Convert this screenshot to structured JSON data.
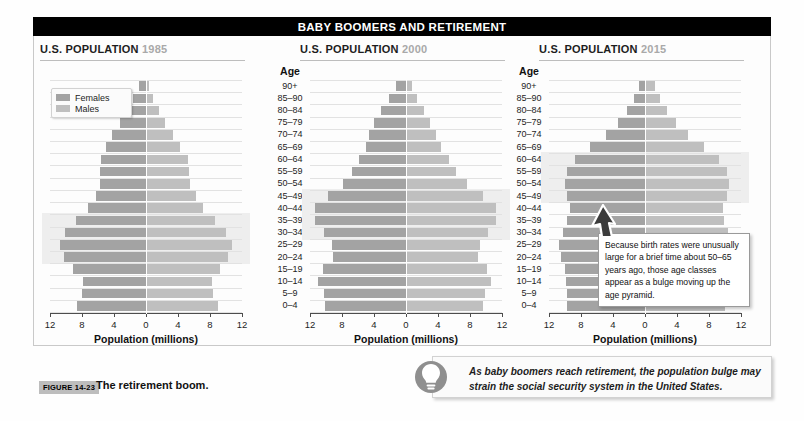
{
  "banner": {
    "title": "BABY BOOMERS AND RETIREMENT"
  },
  "figure": {
    "tag": "FIGURE 14-23",
    "caption": "The retirement boom."
  },
  "legend": {
    "females_label": "Females",
    "males_label": "Males",
    "females_color": "#a3a3a3",
    "males_color": "#bfbfbf"
  },
  "age_axis": {
    "header": "Age",
    "labels": [
      "90+",
      "85–90",
      "80–84",
      "75–79",
      "70–74",
      "65–69",
      "60–64",
      "55–59",
      "50–54",
      "45–49",
      "40–44",
      "35–39",
      "30–34",
      "25–29",
      "20–24",
      "15–19",
      "10–14",
      "5–9",
      "0–4"
    ]
  },
  "x_axis": {
    "label": "Population (millions)",
    "ticks": [
      "12",
      "8",
      "4",
      "0",
      "4",
      "8",
      "12"
    ]
  },
  "callout": {
    "text": "Because birth rates were unusually large for a brief time about 50–65 years ago, those age classes appear as a bulge moving up the age pyramid."
  },
  "tip": {
    "icon": "lightbulb-icon",
    "text": "As baby boomers reach retirement, the population bulge may strain the social security system in the United States."
  },
  "chart_data": [
    {
      "type": "bar",
      "title": "U.S. POPULATION 1985",
      "title_main": "U.S. POPULATION",
      "year": "1985",
      "xlabel": "Population (millions)",
      "ylabel": "Age",
      "xlim": [
        -12,
        12
      ],
      "grid": true,
      "legend_position": "top-left",
      "categories": [
        "90+",
        "85–90",
        "80–84",
        "75–79",
        "70–74",
        "65–69",
        "60–64",
        "55–59",
        "50–54",
        "45–49",
        "40–44",
        "35–39",
        "30–34",
        "25–29",
        "20–24",
        "15–19",
        "10–14",
        "5–9",
        "0–4"
      ],
      "series": [
        {
          "name": "Males",
          "values": [
            0.4,
            0.9,
            1.6,
            2.4,
            3.4,
            4.3,
            5.2,
            5.4,
            5.5,
            6.2,
            7.1,
            8.6,
            10.0,
            10.8,
            10.3,
            9.3,
            8.2,
            8.4,
            9.0
          ]
        },
        {
          "name": "Females",
          "values": [
            0.9,
            1.6,
            2.4,
            3.3,
            4.2,
            5.0,
            5.6,
            5.7,
            5.7,
            6.3,
            7.2,
            8.7,
            10.1,
            10.8,
            10.2,
            9.1,
            7.9,
            8.0,
            8.6
          ]
        }
      ],
      "highlight_bands": [
        {
          "from": "35–39",
          "to": "20–24"
        }
      ]
    },
    {
      "type": "bar",
      "title": "U.S. POPULATION 2000",
      "title_main": "U.S. POPULATION",
      "year": "2000",
      "xlabel": "Population (millions)",
      "ylabel": "Age",
      "xlim": [
        -12,
        12
      ],
      "grid": true,
      "categories": [
        "90+",
        "85–90",
        "80–84",
        "75–79",
        "70–74",
        "65–69",
        "60–64",
        "55–59",
        "50–54",
        "45–49",
        "40–44",
        "35–39",
        "30–34",
        "25–29",
        "20–24",
        "15–19",
        "10–14",
        "5–9",
        "0–4"
      ],
      "series": [
        {
          "name": "Males",
          "values": [
            0.8,
            1.4,
            2.2,
            3.0,
            3.8,
            4.4,
            5.4,
            6.3,
            7.6,
            9.6,
            11.2,
            11.3,
            10.2,
            9.2,
            9.0,
            10.1,
            10.6,
            9.9,
            9.6
          ]
        },
        {
          "name": "Females",
          "values": [
            1.2,
            2.1,
            3.1,
            4.0,
            4.6,
            5.0,
            5.9,
            6.7,
            7.9,
            9.8,
            11.4,
            11.4,
            10.3,
            9.3,
            9.1,
            10.4,
            11.0,
            10.3,
            10.1
          ]
        }
      ],
      "highlight_bands": [
        {
          "from": "45–49",
          "to": "30–34"
        }
      ]
    },
    {
      "type": "bar",
      "title": "U.S. POPULATION 2015",
      "title_main": "U.S. POPULATION",
      "year": "2015",
      "xlabel": "Population (millions)",
      "ylabel": "Age",
      "xlim": [
        -12,
        12
      ],
      "grid": true,
      "categories": [
        "90+",
        "85–90",
        "80–84",
        "75–79",
        "70–74",
        "65–69",
        "60–64",
        "55–59",
        "50–54",
        "45–49",
        "40–44",
        "35–39",
        "30–34",
        "25–29",
        "20–24",
        "15–19",
        "10–14",
        "5–9",
        "0–4"
      ],
      "series": [
        {
          "name": "Males",
          "values": [
            1.2,
            1.9,
            2.8,
            3.9,
            5.4,
            7.4,
            9.3,
            10.3,
            10.5,
            10.2,
            9.7,
            9.9,
            10.4,
            11.0,
            10.9,
            10.4,
            10.3,
            10.2,
            10.0
          ]
        },
        {
          "name": "Females",
          "values": [
            0.7,
            1.4,
            2.3,
            3.4,
            4.9,
            6.9,
            8.8,
            9.8,
            10.0,
            9.8,
            9.4,
            9.7,
            10.2,
            10.7,
            10.5,
            10.0,
            9.9,
            9.8,
            9.7
          ]
        }
      ],
      "highlight_bands": [
        {
          "from": "60–64",
          "to": "45–49"
        }
      ]
    }
  ]
}
